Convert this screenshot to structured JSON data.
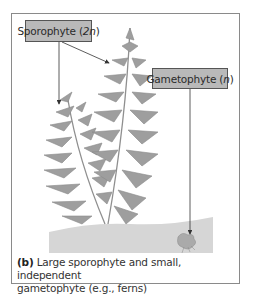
{
  "figure": {
    "panel_label": "(b)",
    "caption": "Large sporophyte and small, independent gametophyte (e.g., ferns)",
    "caption_line1": "Large sporophyte and small, independent",
    "caption_line2": "gametophyte (e.g., ferns)",
    "labels": {
      "sporophyte": {
        "text": "Sporophyte (",
        "ploidy": "2n",
        "close": ")"
      },
      "gametophyte": {
        "text": "Gametophyte (",
        "ploidy": "n",
        "close": ")"
      }
    },
    "colors": {
      "label_fill": "#b9b9b9",
      "fern": "#9a9a9a",
      "ground": "#d6d6d6",
      "frame": "#8a8a8a"
    }
  }
}
